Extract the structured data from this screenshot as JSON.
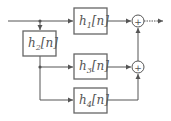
{
  "diagram": {
    "type": "signal-flow block diagram",
    "blocks": [
      {
        "id": "h1",
        "base": "h",
        "sub": "1",
        "arg": "[n]"
      },
      {
        "id": "h2",
        "base": "h",
        "sub": "2",
        "arg": "[n]"
      },
      {
        "id": "h3",
        "base": "h",
        "sub": "3",
        "arg": "[n]"
      },
      {
        "id": "h4",
        "base": "h",
        "sub": "4",
        "arg": "[n]"
      }
    ],
    "summers": [
      {
        "id": "sum1",
        "symbol": "+"
      },
      {
        "id": "sum2",
        "symbol": "+"
      }
    ],
    "connections": [
      "input -> junction1",
      "junction1 -> h1",
      "junction1 -> h2",
      "h2 -> junction2",
      "junction2 -> h3",
      "junction2 -> h4",
      "h1 -> sum1",
      "h3 -> sum2",
      "h4 -> sum2",
      "sum2 -> sum1",
      "sum1 -> output"
    ],
    "colors": {
      "line": "#555555",
      "box_border": "#666666",
      "background": "#ffffff"
    }
  }
}
